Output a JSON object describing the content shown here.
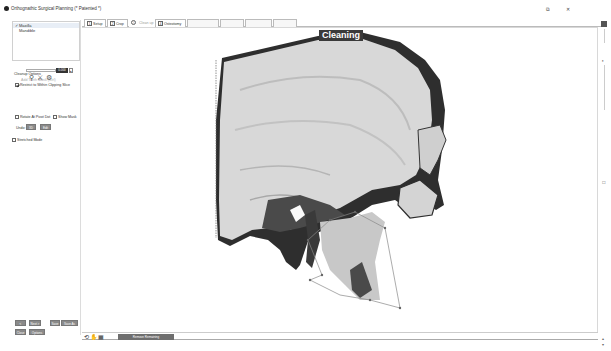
{
  "window": {
    "title": "Orthognathic Surgical Planning (* Patented *)",
    "controls": {
      "restore": "⧉",
      "close": "✕"
    }
  },
  "tree": {
    "items": [
      {
        "label": "Maxilla",
        "checked": true,
        "selected": true
      },
      {
        "label": "Mandible",
        "checked": false,
        "selected": false
      }
    ]
  },
  "tabs": [
    {
      "num": "1",
      "label": "Setup",
      "state": "done"
    },
    {
      "num": "2",
      "label": "Crop",
      "state": "done"
    },
    {
      "num": "3",
      "label": "",
      "state": "circle"
    },
    {
      "num": "",
      "label": "Clean up",
      "state": "current"
    },
    {
      "num": "4",
      "label": "Osteotomy",
      "state": "done"
    },
    {
      "num": "",
      "label": "",
      "state": "disabled"
    },
    {
      "num": "",
      "label": "",
      "state": "disabled"
    },
    {
      "num": "",
      "label": "",
      "state": "disabled"
    },
    {
      "num": "",
      "label": "",
      "state": "disabled"
    }
  ],
  "cleanup": {
    "heading": "Cleanup Options",
    "add_teeth_mask": "Add Teeth Mask (Ctrl)",
    "restrict_label": "Restrict to Within Clipping Slice",
    "restrict_checked": true,
    "slider_value": "0.000",
    "spin": "▴",
    "tool_icons": [
      "⚲",
      "⚔",
      "⚙"
    ],
    "rotate_label": "Rotate At Pivot Dot",
    "rotate_checked": false,
    "show_mask_label": "Show Mask",
    "show_mask_checked": false,
    "undo_label": "Undo:",
    "undo_btn_1": "3D",
    "undo_btn_2": "Edit",
    "stretched_label": "Stretched Mode",
    "stretched_checked": false
  },
  "nav_buttons": {
    "back": "< Back",
    "next": "Next >",
    "save": "Save",
    "save_as": "Save As",
    "close": "Close",
    "options": "Options"
  },
  "viewport": {
    "overlay_label": "Cleaning"
  },
  "bottom_bar": {
    "icons": [
      "⟲",
      "✋",
      "▦"
    ],
    "remove_button": "Remove Remaining"
  },
  "right_rail": {
    "icons": [
      "▮",
      "⎘",
      "◐",
      "⇅",
      "☐",
      "▴",
      "▾"
    ]
  },
  "colors": {
    "tab_border": "#bbbbbb",
    "button_gray": "#8a8a8a",
    "overlay_bg": "#3a3a3a",
    "bone_light": "#d6d6d6",
    "bone_dark": "#2e2e2e"
  }
}
